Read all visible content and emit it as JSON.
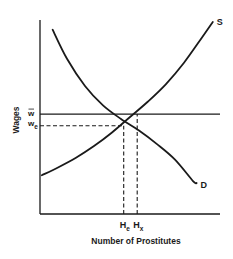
{
  "chart_data": {
    "type": "line",
    "title": "",
    "xlabel": "Number of Prostitutes",
    "ylabel": "Wages",
    "xlim": [
      0,
      100
    ],
    "ylim": [
      0,
      100
    ],
    "grid": false,
    "series": [
      {
        "name": "S",
        "label": "S",
        "kind": "supply",
        "x": [
          1,
          10,
          20,
          30,
          40,
          50,
          60,
          70,
          80,
          90,
          96
        ],
        "y": [
          20,
          24,
          29,
          35,
          42,
          50,
          58,
          67,
          78,
          91,
          99
        ]
      },
      {
        "name": "D",
        "label": "D",
        "kind": "demand",
        "x": [
          7,
          15,
          25,
          35,
          45,
          55,
          65,
          75,
          85,
          87
        ],
        "y": [
          95,
          80,
          66,
          56,
          49,
          43,
          36,
          28,
          17,
          16
        ]
      }
    ],
    "reference_lines": [
      {
        "name": "w-bar",
        "orientation": "horizontal",
        "value": 51.5,
        "style": "solid",
        "x_from": 0,
        "x_to": 100
      },
      {
        "name": "w-e",
        "orientation": "horizontal",
        "value": 45.5,
        "style": "dashed",
        "x_from": 0,
        "x_to": 46.5
      },
      {
        "name": "H-e",
        "orientation": "vertical",
        "value": 46.5,
        "style": "dashed",
        "y_from": 0,
        "y_to": 45.5
      },
      {
        "name": "H-x",
        "orientation": "vertical",
        "value": 54,
        "style": "dashed",
        "y_from": 0,
        "y_to": 51.5
      }
    ],
    "y_tick_labels": [
      {
        "value": 51.5,
        "text": "w",
        "decoration": "overbar"
      },
      {
        "value": 45.5,
        "text": "w",
        "subscript": "e"
      }
    ],
    "x_tick_labels": [
      {
        "value": 46.5,
        "text": "H",
        "subscript": "e"
      },
      {
        "value": 54,
        "text": "H",
        "subscript": "x"
      }
    ],
    "curve_labels": [
      {
        "series": "S",
        "text": "S"
      },
      {
        "series": "D",
        "text": "D"
      }
    ]
  }
}
